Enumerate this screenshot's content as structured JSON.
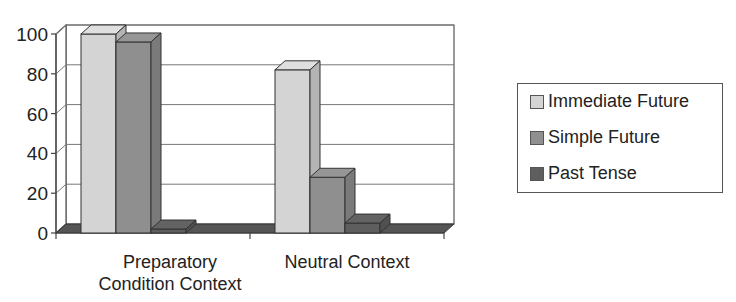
{
  "chart_data": {
    "type": "bar",
    "style": "3d-clustered-column",
    "title": "",
    "xlabel": "",
    "ylabel": "",
    "categories": [
      "Preparatory Condition Context",
      "Neutral Context"
    ],
    "category_labels": [
      [
        "Preparatory",
        "Condition Context"
      ],
      [
        "Neutral Context"
      ]
    ],
    "series": [
      {
        "name": "Immediate Future",
        "values": [
          100,
          82
        ],
        "color": "#d4d4d4"
      },
      {
        "name": "Simple Future",
        "values": [
          96,
          28
        ],
        "color": "#8f8f8f"
      },
      {
        "name": "Past Tense",
        "values": [
          2,
          5
        ],
        "color": "#5e5e5e"
      }
    ],
    "ylim": [
      0,
      100
    ],
    "yticks": [
      "0",
      "20",
      "40",
      "60",
      "80",
      "100"
    ],
    "grid": true,
    "legend_position": "right"
  },
  "legend": {
    "items": [
      {
        "label": "Immediate Future",
        "color": "#d4d4d4"
      },
      {
        "label": "Simple Future",
        "color": "#8f8f8f"
      },
      {
        "label": "Past Tense",
        "color": "#5e5e5e"
      }
    ]
  }
}
